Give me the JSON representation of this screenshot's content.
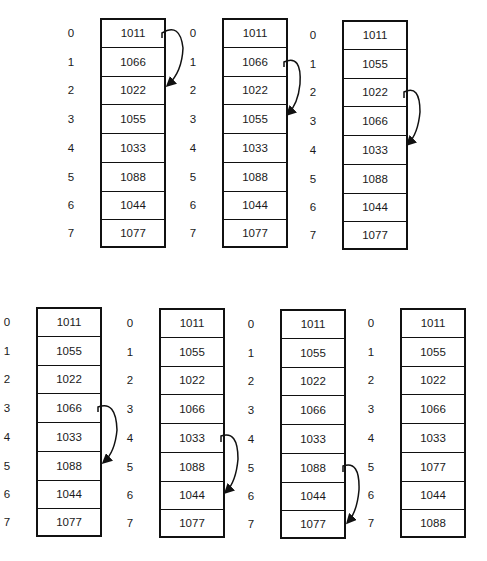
{
  "diagram": {
    "arrays": [
      {
        "indices": [
          "0",
          "1",
          "2",
          "3",
          "4",
          "5",
          "6",
          "7"
        ],
        "values": [
          "1011",
          "1066",
          "1022",
          "1055",
          "1033",
          "1088",
          "1044",
          "1077"
        ],
        "arrow": {
          "from": 0,
          "to": 2
        }
      },
      {
        "indices": [
          "0",
          "1",
          "2",
          "3",
          "4",
          "5",
          "6",
          "7"
        ],
        "values": [
          "1011",
          "1066",
          "1022",
          "1055",
          "1033",
          "1088",
          "1044",
          "1077"
        ],
        "arrow": {
          "from": 1,
          "to": 3
        }
      },
      {
        "indices": [
          "0",
          "1",
          "2",
          "3",
          "4",
          "5",
          "6",
          "7"
        ],
        "values": [
          "1011",
          "1055",
          "1022",
          "1066",
          "1033",
          "1088",
          "1044",
          "1077"
        ],
        "arrow": {
          "from": 2,
          "to": 4
        }
      },
      {
        "indices": [
          "0",
          "1",
          "2",
          "3",
          "4",
          "5",
          "6",
          "7"
        ],
        "values": [
          "1011",
          "1055",
          "1022",
          "1066",
          "1033",
          "1088",
          "1044",
          "1077"
        ],
        "arrow": {
          "from": 3,
          "to": 5
        }
      },
      {
        "indices": [
          "0",
          "1",
          "2",
          "3",
          "4",
          "5",
          "6",
          "7"
        ],
        "values": [
          "1011",
          "1055",
          "1022",
          "1066",
          "1033",
          "1088",
          "1044",
          "1077"
        ],
        "arrow": {
          "from": 4,
          "to": 6
        }
      },
      {
        "indices": [
          "0",
          "1",
          "2",
          "3",
          "4",
          "5",
          "6",
          "7"
        ],
        "values": [
          "1011",
          "1055",
          "1022",
          "1066",
          "1033",
          "1088",
          "1044",
          "1077"
        ],
        "arrow": {
          "from": 5,
          "to": 7
        }
      },
      {
        "indices": [
          "0",
          "1",
          "2",
          "3",
          "4",
          "5",
          "6",
          "7"
        ],
        "values": [
          "1011",
          "1055",
          "1022",
          "1066",
          "1033",
          "1077",
          "1044",
          "1088"
        ],
        "arrow": null
      }
    ]
  }
}
